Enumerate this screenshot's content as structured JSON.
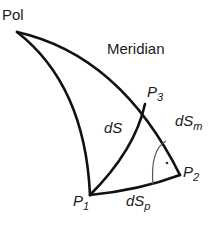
{
  "diagram": {
    "labels": {
      "pole": "Pol",
      "meridian": "Meridian",
      "p1": {
        "base": "P",
        "sub": "1"
      },
      "p2": {
        "base": "P",
        "sub": "2"
      },
      "p3": {
        "base": "P",
        "sub": "3"
      },
      "ds": "dS",
      "dsm": {
        "base": "dS",
        "sub": "m"
      },
      "dsp": {
        "base": "dS",
        "sub": "p"
      }
    },
    "colors": {
      "stroke": "#111111",
      "arc": "#555555",
      "text": "#1a1a1a"
    }
  }
}
